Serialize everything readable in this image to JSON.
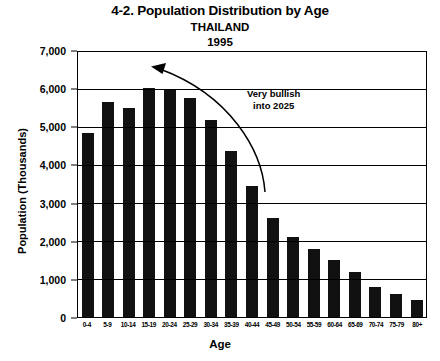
{
  "title": {
    "main": "4-2. Population Distribution by Age",
    "country": "THAILAND",
    "year": "1995"
  },
  "annotation": {
    "text": "Very bullish\ninto 2025",
    "arrow_icon": "curved-arrow-up-left-icon"
  },
  "chart_data": {
    "type": "bar",
    "title": "4-2. Population Distribution by Age",
    "subtitle": "THAILAND 1995",
    "xlabel": "Age",
    "ylabel": "Population (Thousands)",
    "ylim": [
      0,
      7000
    ],
    "ytick_labels": [
      "7,000",
      "6,000",
      "5,000",
      "4,000",
      "3,000",
      "2,000",
      "1,000",
      "0"
    ],
    "ytick_values": [
      7000,
      6000,
      5000,
      4000,
      3000,
      2000,
      1000,
      0
    ],
    "grid": true,
    "legend": false,
    "bar_color": "#111111",
    "categories": [
      "0-4",
      "5-9",
      "10-14",
      "15-19",
      "20-24",
      "25-29",
      "30-34",
      "35-39",
      "40-44",
      "45-49",
      "50-54",
      "55-59",
      "60-64",
      "65-69",
      "70-74",
      "75-79",
      "80+"
    ],
    "values": [
      4880,
      5700,
      5540,
      6080,
      6020,
      5800,
      5220,
      4400,
      3470,
      2620,
      2120,
      1800,
      1500,
      1180,
      800,
      620,
      450
    ],
    "annotations": [
      {
        "text": "Very bullish into 2025",
        "type": "curved-arrow"
      }
    ]
  }
}
